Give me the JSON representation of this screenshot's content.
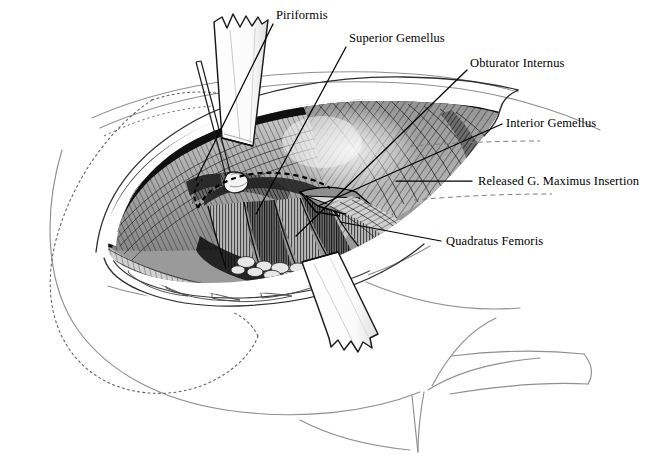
{
  "figure": {
    "style": "pen-and-ink medical illustration, grayscale",
    "background_color": "#ffffff",
    "ink_color": "#000000",
    "guide_color": "#8a8a8a"
  },
  "labels": [
    {
      "id": "piriformis",
      "text": "Piriformis",
      "x": 276,
      "y": 10,
      "leader": {
        "x1": 273,
        "y1": 24,
        "x2": 196,
        "y2": 180
      }
    },
    {
      "id": "superior-gemellus",
      "text": "Superior Gemellus",
      "x": 349,
      "y": 33,
      "leader": {
        "x1": 346,
        "y1": 47,
        "x2": 256,
        "y2": 214
      }
    },
    {
      "id": "obturator-internus",
      "text": "Obturator Internus",
      "x": 470,
      "y": 58,
      "leader": {
        "x1": 467,
        "y1": 70,
        "x2": 296,
        "y2": 236
      }
    },
    {
      "id": "interior-gemellus",
      "text": "Interior Gemellus",
      "x": 506,
      "y": 118,
      "leader": {
        "x1": 502,
        "y1": 124,
        "x2": 318,
        "y2": 206
      }
    },
    {
      "id": "released-g-maximus-insertion",
      "text": "Released G. Maximus Insertion",
      "x": 478,
      "y": 176,
      "leader": {
        "x1": 472,
        "y1": 181,
        "x2": 396,
        "y2": 181
      }
    },
    {
      "id": "quadratus-femoris",
      "text": "Quadratus Femoris",
      "x": 446,
      "y": 236,
      "leader": {
        "x1": 441,
        "y1": 241,
        "x2": 340,
        "y2": 222
      }
    }
  ],
  "annotations": {
    "dotted_cut_line": "dashed arc over released gluteus maximus insertion",
    "dashed_guides": 2,
    "dotted_body_outline": "subcutaneous/underlying bone outline at left"
  },
  "instruments": [
    {
      "id": "upper-retractor-blade",
      "kind": "retractor-blade",
      "orientation": "vertical"
    },
    {
      "id": "hook-retractor",
      "kind": "hook-retractor",
      "orientation": "oblique"
    },
    {
      "id": "lower-retractor-blade",
      "kind": "retractor-blade",
      "orientation": "oblique"
    }
  ]
}
